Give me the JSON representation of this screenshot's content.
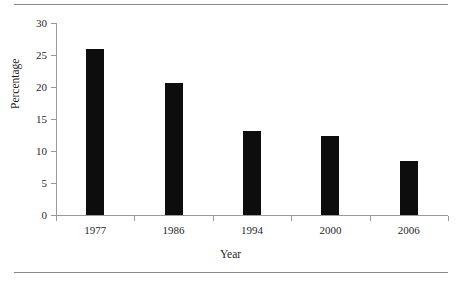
{
  "chart_data": {
    "type": "bar",
    "title": "",
    "subtitle": "",
    "xlabel": "Year",
    "ylabel": "Percentage",
    "categories": [
      "1977",
      "1986",
      "1994",
      "2000",
      "2006"
    ],
    "values": [
      26.0,
      20.7,
      13.2,
      12.3,
      8.5
    ],
    "series": [
      {
        "name": "Percentage",
        "values": [
          26.0,
          20.7,
          13.2,
          12.3,
          8.5
        ]
      }
    ],
    "ylim": [
      0,
      30
    ],
    "ytick_labels": [
      "0",
      "5",
      "10",
      "15",
      "20",
      "25",
      "30"
    ],
    "ytick_values": [
      0,
      5,
      10,
      15,
      20,
      25,
      30
    ],
    "grid": false,
    "legend": "none",
    "bar_color": "#0d0d0d",
    "axis_color": "#9a9a9a",
    "rule_color": "#8a8a8a",
    "annotations": []
  }
}
